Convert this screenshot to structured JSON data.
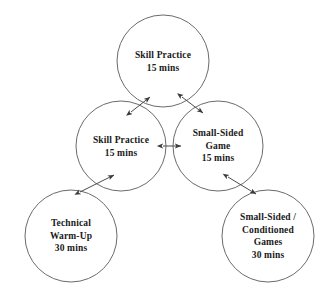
{
  "diagram": {
    "type": "cycle-flow-diagram",
    "background_color": "#ffffff",
    "circle_stroke_color": "#6b6b6b",
    "arrow_color": "#4a4a4a",
    "text_color": "#1a1a1a",
    "nodes": [
      {
        "id": "skill-practice-top",
        "name": "skill-practice-top",
        "lines": [
          "Skill Practice",
          "15 mins"
        ],
        "activity": "Skill Practice",
        "duration": "15 mins",
        "cx": 163,
        "cy": 61,
        "r": 46
      },
      {
        "id": "skill-practice-middle",
        "name": "skill-practice-middle",
        "lines": [
          "Skill Practice",
          "15 mins"
        ],
        "activity": "Skill Practice",
        "duration": "15 mins",
        "cx": 121,
        "cy": 146,
        "r": 45
      },
      {
        "id": "small-sided-game",
        "name": "small-sided-game",
        "lines": [
          "Small-Sided",
          "Game",
          "15 mins"
        ],
        "activity": "Small-Sided Game",
        "duration": "15 mins",
        "cx": 218,
        "cy": 146,
        "r": 45
      },
      {
        "id": "technical-warm-up",
        "name": "technical-warm-up",
        "lines": [
          "Technical",
          "Warm-Up",
          "30 mins"
        ],
        "activity": "Technical Warm-Up",
        "duration": "30 mins",
        "cx": 71,
        "cy": 236,
        "r": 46
      },
      {
        "id": "small-sided-conditioned-games",
        "name": "small-sided-conditioned-games",
        "lines": [
          "Small-Sided /",
          "Conditioned",
          "Games",
          "30 mins"
        ],
        "activity": "Small-Sided / Conditioned Games",
        "duration": "30 mins",
        "cx": 268,
        "cy": 236,
        "r": 46
      }
    ],
    "connectors": [
      {
        "id": "warmup-to-skill-practice-middle",
        "name": "arrow-technical-warm-up-to-skill-practice-middle",
        "from": "technical-warm-up",
        "to": "skill-practice-middle",
        "style": "double-headed",
        "x1": 80,
        "y1": 192,
        "x2": 114,
        "y2": 175
      },
      {
        "id": "skill-practice-middle-to-top",
        "name": "arrow-skill-practice-middle-to-skill-practice-top",
        "from": "skill-practice-middle",
        "to": "skill-practice-top",
        "style": "double-headed",
        "x1": 131,
        "y1": 112,
        "x2": 150,
        "y2": 97
      },
      {
        "id": "skill-practice-top-to-game",
        "name": "arrow-skill-practice-top-to-small-sided-game",
        "from": "skill-practice-top",
        "to": "small-sided-game",
        "style": "double-headed",
        "x1": 182,
        "y1": 97,
        "x2": 203,
        "y2": 113
      },
      {
        "id": "skill-practice-middle-to-game",
        "name": "arrow-skill-practice-middle-to-small-sided-game",
        "from": "skill-practice-middle",
        "to": "small-sided-game",
        "style": "double-headed",
        "x1": 163,
        "y1": 146,
        "x2": 181,
        "y2": 146
      },
      {
        "id": "game-to-conditioned-games",
        "name": "arrow-small-sided-game-to-conditioned-games",
        "from": "small-sided-game",
        "to": "small-sided-conditioned-games",
        "style": "double-headed",
        "x1": 228,
        "y1": 177,
        "x2": 256,
        "y2": 194
      }
    ]
  }
}
